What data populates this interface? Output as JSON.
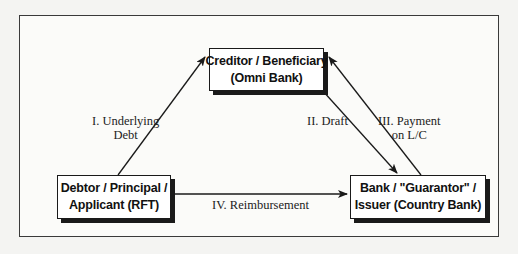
{
  "diagram": {
    "nodes": {
      "creditor": {
        "line1": "Creditor / Beneficiary",
        "line2": "(Omni Bank)"
      },
      "debtor": {
        "line1": "Debtor / Principal /",
        "line2": "Applicant (RFT)"
      },
      "bank": {
        "line1": "Bank / \"Guarantor\" /",
        "line2": "Issuer (Country Bank)"
      }
    },
    "edges": [
      {
        "id": "I",
        "from": "debtor",
        "to": "creditor",
        "label_line1": "I. Underlying",
        "label_line2": "Debt"
      },
      {
        "id": "II",
        "from": "creditor",
        "to": "bank",
        "label_line1": "II. Draft"
      },
      {
        "id": "III",
        "from": "bank",
        "to": "creditor",
        "label_line1": "III. Payment",
        "label_line2": "on L/C"
      },
      {
        "id": "IV",
        "from": "debtor",
        "to": "bank",
        "label_line1": "IV. Reimbursement"
      }
    ],
    "colors": {
      "line": "#1a1a1a",
      "frame": "#3a3a3a",
      "box_fill": "#ffffff"
    }
  }
}
